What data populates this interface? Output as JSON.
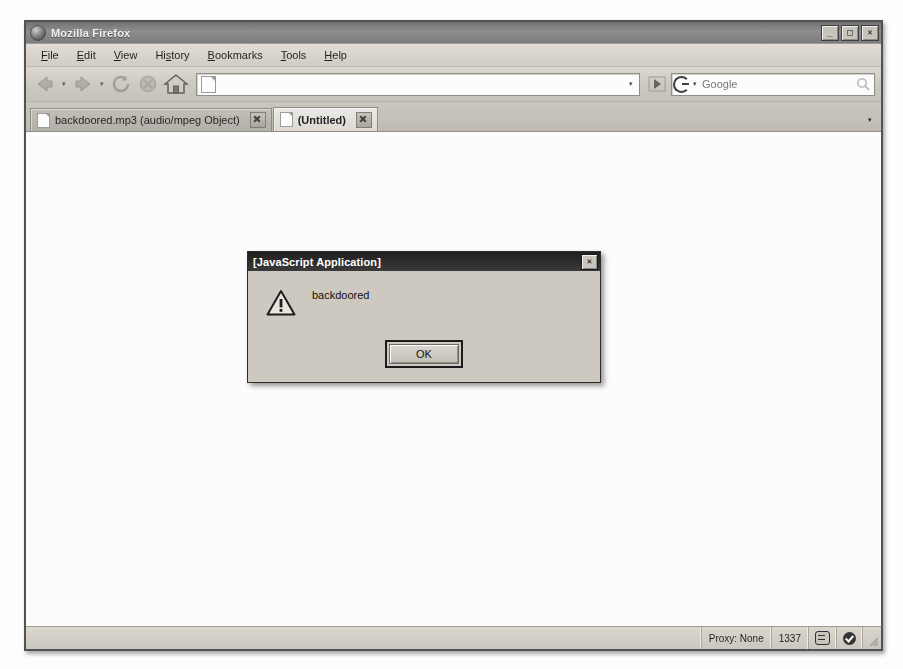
{
  "window": {
    "title": "Mozilla Firefox",
    "icon": "firefox-icon",
    "minimize_label": "_",
    "maximize_label": "□",
    "close_label": "✕"
  },
  "menu": {
    "items": [
      {
        "label": "File",
        "accesskey": "F"
      },
      {
        "label": "Edit",
        "accesskey": "E"
      },
      {
        "label": "View",
        "accesskey": "V"
      },
      {
        "label": "History",
        "accesskey": "s"
      },
      {
        "label": "Bookmarks",
        "accesskey": "B"
      },
      {
        "label": "Tools",
        "accesskey": "T"
      },
      {
        "label": "Help",
        "accesskey": "H"
      }
    ]
  },
  "toolbar": {
    "back_label": "Back",
    "forward_label": "Forward",
    "reload_label": "Reload",
    "stop_label": "Stop",
    "home_label": "Home",
    "go_label": "Go",
    "url": {
      "value": "",
      "placeholder": "",
      "dropdown_label": "▾"
    },
    "search": {
      "engine": "Google",
      "value": "",
      "placeholder": "Google",
      "dropdown_label": "▾",
      "submit_label": "Search"
    }
  },
  "tabs": {
    "items": [
      {
        "label": "backdoored.mp3 (audio/mpeg Object)",
        "active": false,
        "close_label": "✕"
      },
      {
        "label": "(Untitled)",
        "active": true,
        "close_label": "✕"
      }
    ],
    "list_all_label": "▾"
  },
  "content": {
    "body_text": ""
  },
  "statusbar": {
    "message": "",
    "cells": [
      {
        "label": "Proxy: None",
        "name": "proxy-status"
      },
      {
        "label": "1337",
        "name": "port-status"
      }
    ],
    "icons": [
      {
        "name": "robot-icon",
        "label": ""
      },
      {
        "name": "check-circle-icon",
        "label": ""
      }
    ]
  },
  "dialog": {
    "title": "[JavaScript Application]",
    "close_label": "✕",
    "icon": "warning-triangle-icon",
    "message": "backdoored",
    "ok_label": "OK"
  },
  "colors": {
    "chrome": "#d4d0c8",
    "titlebar": "#7a7a7a",
    "dialog_titlebar": "#2b2b2b",
    "content_bg": "#ffffff",
    "text": "#111111"
  }
}
